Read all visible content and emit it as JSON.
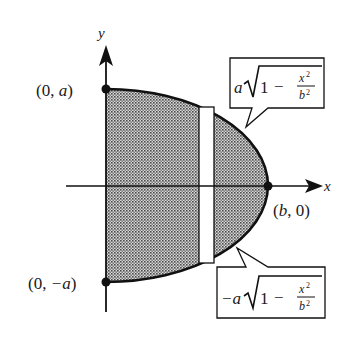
{
  "diagram": {
    "axes": {
      "x_label": "x",
      "y_label": "y"
    },
    "points": [
      {
        "id": "top",
        "label": "(0, a)",
        "label_prefix": "(0, ",
        "label_var": "a",
        "label_suffix": ")"
      },
      {
        "id": "bottom",
        "label": "(0, −a)",
        "label_prefix": "(0, ",
        "label_var": "−a",
        "label_suffix": ")"
      },
      {
        "id": "right",
        "label": "(b, 0)",
        "label_prefix": "(",
        "label_var": "b",
        "label_suffix": ", 0)"
      }
    ],
    "callouts": {
      "upper": {
        "formula": "a√(1 − x²/b²)",
        "coef": "a",
        "radical_one": "1",
        "minus": "−",
        "num": "x",
        "num_exp": "2",
        "den": "b",
        "den_exp": "2"
      },
      "lower": {
        "formula": "−a√(1 − x²/b²)",
        "coef": "−a",
        "radical_one": "1",
        "minus": "−",
        "num": "x",
        "num_exp": "2",
        "den": "b",
        "den_exp": "2"
      }
    },
    "colors": {
      "stroke": "#111111",
      "fill_dots": "#555555",
      "strip_fill": "#ffffff",
      "background": "#ffffff"
    }
  }
}
